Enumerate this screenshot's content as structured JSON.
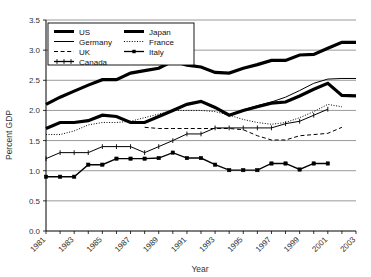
{
  "chart_data": {
    "type": "line",
    "title": "",
    "xlabel": "Year",
    "ylabel": "Percent GDP",
    "xlim": [
      1981,
      2003
    ],
    "ylim": [
      0.0,
      3.5
    ],
    "ytick_step": 0.5,
    "grid": "horizontal",
    "legend_position": "top-left",
    "x": [
      1981,
      1982,
      1983,
      1984,
      1985,
      1986,
      1987,
      1988,
      1989,
      1990,
      1991,
      1992,
      1993,
      1994,
      1995,
      1996,
      1997,
      1998,
      1999,
      2000,
      2001,
      2002,
      2003
    ],
    "yticks": [
      "0.0",
      "0.5",
      "1.0",
      "1.5",
      "2.0",
      "2.5",
      "3.0",
      "3.5"
    ],
    "xticks": [
      "1981",
      "1983",
      "1985",
      "1987",
      "1989",
      "1991",
      "1993",
      "1995",
      "1997",
      "1999",
      "2001",
      "2003"
    ],
    "series": [
      {
        "name": "US",
        "style": "thick-solid",
        "marker": "none",
        "color": "#000000",
        "width": 3.2,
        "values": [
          1.7,
          1.8,
          1.8,
          1.83,
          1.92,
          1.9,
          1.8,
          1.8,
          1.9,
          2.0,
          2.1,
          2.15,
          2.05,
          1.92,
          2.0,
          2.06,
          2.12,
          2.14,
          2.24,
          2.35,
          2.45,
          2.25,
          2.24
        ]
      },
      {
        "name": "Germany",
        "style": "thin-solid",
        "marker": "none",
        "color": "#000000",
        "width": 1.0,
        "values": [
          1.7,
          1.79,
          1.8,
          1.83,
          1.92,
          1.9,
          1.81,
          1.8,
          1.9,
          2.0,
          2.1,
          2.15,
          2.05,
          1.93,
          2.01,
          2.08,
          2.14,
          2.22,
          2.33,
          2.45,
          2.52,
          2.53,
          2.53
        ]
      },
      {
        "name": "UK",
        "style": "dashed",
        "marker": "none",
        "color": "#000000",
        "width": 1.0,
        "values": [
          null,
          null,
          null,
          null,
          null,
          null,
          null,
          1.72,
          1.7,
          1.7,
          1.7,
          1.7,
          1.7,
          1.7,
          1.68,
          1.58,
          1.51,
          1.51,
          1.58,
          1.6,
          1.62,
          1.72,
          null
        ]
      },
      {
        "name": "Canada",
        "style": "thin-solid-marker",
        "marker": "plus",
        "color": "#000000",
        "width": 1.0,
        "values": [
          1.2,
          1.3,
          1.3,
          1.3,
          1.4,
          1.4,
          1.4,
          1.3,
          1.4,
          1.5,
          1.61,
          1.61,
          1.71,
          1.71,
          1.71,
          1.71,
          1.71,
          1.78,
          1.82,
          1.92,
          2.02,
          null,
          null
        ]
      },
      {
        "name": "Japan",
        "style": "thick-solid",
        "marker": "none",
        "color": "#000000",
        "width": 3.2,
        "values": [
          2.1,
          2.22,
          2.32,
          2.42,
          2.51,
          2.51,
          2.62,
          2.66,
          2.7,
          2.82,
          2.75,
          2.72,
          2.63,
          2.62,
          2.7,
          2.76,
          2.83,
          2.83,
          2.92,
          2.93,
          3.03,
          3.13,
          3.13
        ]
      },
      {
        "name": "France",
        "style": "dotted",
        "marker": "none",
        "color": "#000000",
        "width": 1.0,
        "values": [
          1.6,
          1.6,
          1.66,
          1.76,
          1.8,
          1.8,
          1.82,
          1.88,
          1.94,
          2.0,
          2.0,
          2.0,
          1.98,
          1.92,
          1.85,
          1.8,
          1.77,
          1.8,
          1.88,
          1.98,
          2.1,
          2.06,
          null
        ]
      },
      {
        "name": "Italy",
        "style": "thick-marker",
        "marker": "square",
        "color": "#000000",
        "width": 1.4,
        "values": [
          0.9,
          0.9,
          0.9,
          1.1,
          1.1,
          1.2,
          1.2,
          1.2,
          1.21,
          1.3,
          1.21,
          1.21,
          1.1,
          1.01,
          1.01,
          1.01,
          1.12,
          1.12,
          1.02,
          1.12,
          1.12,
          null,
          null
        ]
      }
    ]
  },
  "legend": {
    "entries": [
      {
        "label": "US",
        "style": "thick-solid"
      },
      {
        "label": "Japan",
        "style": "thick-solid"
      },
      {
        "label": "Germany",
        "style": "thin-solid"
      },
      {
        "label": "France",
        "style": "dotted"
      },
      {
        "label": "UK",
        "style": "dashed"
      },
      {
        "label": "Italy",
        "style": "thick-marker"
      },
      {
        "label": "Canada",
        "style": "thin-solid-marker"
      }
    ]
  }
}
